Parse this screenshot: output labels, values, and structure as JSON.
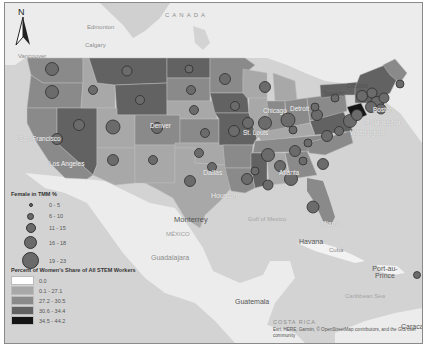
{
  "map": {
    "north_arrow": {
      "label": "N",
      "icon": "north-arrow-icon"
    },
    "labels": {
      "canada": "CANADA",
      "edmonton": "Edmonton",
      "calgary": "Calgary",
      "vancouver": "Vancouver",
      "ottawa": "Ottawa",
      "toronto": "Toronto",
      "chicago": "Chicago",
      "detroit": "Detroit",
      "st_louis": "St. Louis",
      "denver": "Denver",
      "dallas": "Dallas",
      "houston": "Houston",
      "san_francisco": "San Francisco",
      "los_angeles": "Los Angeles",
      "atlanta": "Atlanta",
      "miami": "Miami",
      "boston": "Boston",
      "philadelphia": "Philadelphia",
      "washington": "Washington",
      "monterrey": "Monterrey",
      "mexico": "MÉXICO",
      "guadalajara": "Guadalajara",
      "gulf_of_mexico": "Gulf of Mexico",
      "havana": "Havana",
      "cuba": "Cuba",
      "port_au_prince": "Port-au-Prince",
      "caribbean_sea": "Caribbean Sea",
      "guatemala": "Guatemala",
      "costa_rica": "COSTA RICA",
      "caracas": "Caracas"
    },
    "attribution": "Esri, HERE, Garmin, © OpenStreetMap contributors, and the GIS user community"
  },
  "legend": {
    "symbol_title": "Female in TMM %",
    "symbol_classes": [
      {
        "label": "0 - 5",
        "size": 4
      },
      {
        "label": "6 - 10",
        "size": 7
      },
      {
        "label": "11 - 15",
        "size": 10
      },
      {
        "label": "16 - 18",
        "size": 13
      },
      {
        "label": "19 - 23",
        "size": 17
      }
    ],
    "fill_title": "Percent of Women's Share of All STEM Workers",
    "fill_classes": [
      {
        "label": "0.0",
        "color": "#ffffff"
      },
      {
        "label": "0.1 - 27.1",
        "color": "#a8a8a8"
      },
      {
        "label": "27.2 - 30.5",
        "color": "#8a8a8a"
      },
      {
        "label": "30.6 - 34.4",
        "color": "#626262"
      },
      {
        "label": "34.5 - 44.2",
        "color": "#141414"
      }
    ]
  },
  "colors": {
    "water": "#d3d3d3",
    "land_foreign": "#ececec",
    "class1": "#a8a8a8",
    "class2": "#8a8a8a",
    "class3": "#626262",
    "class4": "#141414",
    "dot_fill": "#6b6b6b",
    "dot_stroke": "#2f2f2f"
  }
}
